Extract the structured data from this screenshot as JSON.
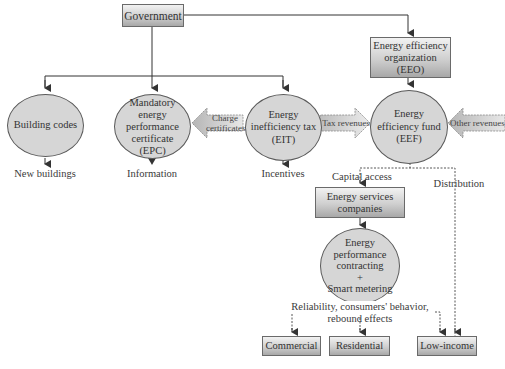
{
  "nodes": {
    "government": {
      "label": "Government"
    },
    "eeo": {
      "label": "Energy efficiency organization (EEO)",
      "lines": [
        "Energy efficiency",
        "organization",
        "(EEO)"
      ]
    },
    "building_codes": {
      "label": "Building codes"
    },
    "epc": {
      "lines": [
        "Mandatory",
        "energy",
        "performance",
        "certificate",
        "(EPC)"
      ]
    },
    "eit": {
      "lines": [
        "Energy",
        "inefficiency tax",
        "(EIT)"
      ]
    },
    "eef": {
      "lines": [
        "Energy",
        "efficiency fund",
        "(EEF)"
      ]
    },
    "esco": {
      "lines": [
        "Energy services",
        "companies"
      ]
    },
    "epc_smart": {
      "lines": [
        "Energy",
        "performance",
        "contracting",
        "+",
        "Smart metering"
      ]
    },
    "commercial": {
      "label": "Commercial"
    },
    "residential": {
      "label": "Residential"
    },
    "low_income": {
      "label": "Low-income"
    }
  },
  "outputs": {
    "new_buildings": "New buildings",
    "information": "Information",
    "incentives": "Incentives"
  },
  "flows": {
    "charge_certificates": [
      "Charge",
      "certificates"
    ],
    "tax_revenues": "Tax revenues",
    "other_revenues": "Other revenues",
    "capital_access": "Capital access",
    "distribution": "Distribution",
    "reliability": [
      "Reliability, consumers' behavior,",
      "rebound effects"
    ]
  },
  "colors": {
    "ellipse_fill": "#d6d6d6",
    "box_gradient_top": "#f2f2f2",
    "box_gradient_bottom": "#a8a8a8",
    "line": "#3a3a3a"
  }
}
